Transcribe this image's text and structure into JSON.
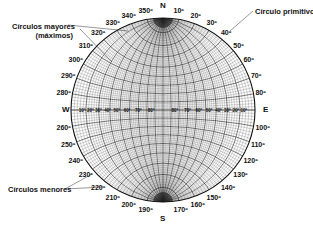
{
  "net": {
    "center": [
      163,
      110
    ],
    "radius": 92,
    "grid_step_deg": 2,
    "major_step_deg": 10,
    "line_color": "#222222",
    "minor_line_color": "#555555"
  },
  "cardinals": {
    "north": "N",
    "south": "S",
    "east": "E",
    "west": "W"
  },
  "azimuth_labels": [
    "10º",
    "20º",
    "30º",
    "40º",
    "50º",
    "60º",
    "70º",
    "80º",
    "100º",
    "110º",
    "120º",
    "130º",
    "140º",
    "150º",
    "160º",
    "170º",
    "190º",
    "200º",
    "210º",
    "220º",
    "230º",
    "240º",
    "250º",
    "260º",
    "280º",
    "290º",
    "300º",
    "310º",
    "320º",
    "330º",
    "340º",
    "350º"
  ],
  "equator_labels": [
    "10º",
    "20º",
    "30º",
    "40º",
    "50º",
    "60º",
    "70º",
    "80º"
  ],
  "callouts": {
    "great_circles": "Círculos mayores\n(máximos)",
    "great_circles_line1": "Círculos mayores",
    "great_circles_line2": "(máximos)",
    "primitive_circle": "Círculo primitivo",
    "small_circles": "Círculos menores"
  }
}
